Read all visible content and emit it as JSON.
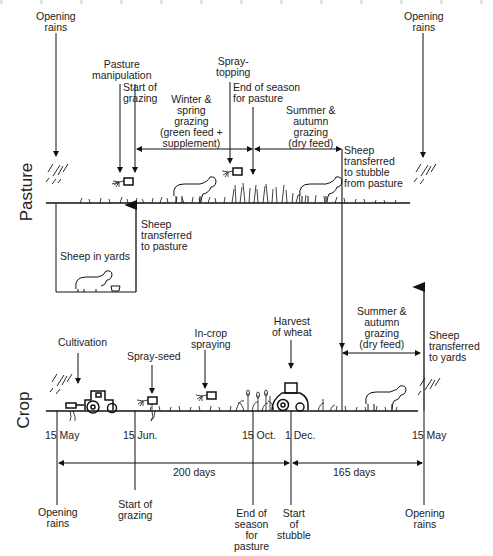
{
  "pasture": {
    "side_label": "Pasture",
    "labels": {
      "opening_rains_left": "Opening\nrains",
      "opening_rains_right": "Opening\nrains",
      "pasture_manipulation": "Pasture\nmanipulation",
      "start_of_grazing": "Start of\ngrazing",
      "winter_spring": "Winter &\nspring\ngrazing\n(green feed +\nsupplement)",
      "spray_topping": "Spray-\ntopping",
      "end_of_season": "End of season\nfor pasture",
      "summer_autumn": "Summer &\nautumn\ngrazing\n(dry feed)",
      "sheep_to_stubble": "Sheep\ntransferred\nto stubble\nfrom pasture",
      "sheep_to_pasture": "Sheep\ntransferred\nto pasture",
      "sheep_in_yards": "Sheep in yards"
    }
  },
  "crop": {
    "side_label": "Crop",
    "labels": {
      "cultivation": "Cultivation",
      "spray_seed": "Spray-seed",
      "in_crop_spraying": "In-crop\nspraying",
      "harvest": "Harvest\nof wheat",
      "summer_autumn": "Summer &\nautumn\ngrazing\n(dry feed)",
      "sheep_to_yards": "Sheep\ntransferred\nto yards"
    },
    "dates": [
      "15 May",
      "15 Jun.",
      "15 Oct.",
      "1 Dec.",
      "15 May"
    ],
    "durations": [
      "200 days",
      "165 days"
    ],
    "bottom_labels": {
      "opening_rains_left": "Opening\nrains",
      "start_of_grazing": "Start of\ngrazing",
      "end_of_season": "End of\nseason\nfor\npasture",
      "start_of_stubble": "Start\nof\nstubble",
      "opening_rains_right": "Opening\nrains"
    }
  }
}
